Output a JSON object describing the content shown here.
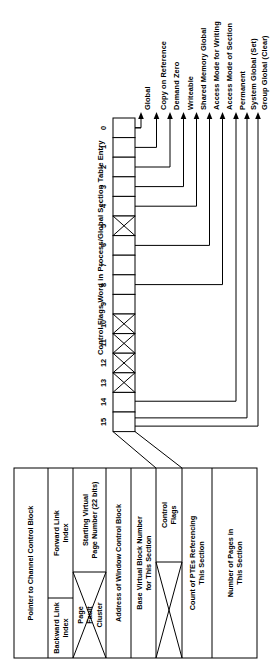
{
  "figure": {
    "title": "Control Flags Word in Process/Global Section Table Entry",
    "orientation": "rotated-90-ccw",
    "ink_color": "#000000",
    "paper_color": "#ffffff"
  },
  "bitfield": {
    "name": "control-flags-word",
    "bit_count": 16,
    "bit_labels": [
      "0",
      "1",
      "2",
      "3",
      "4",
      "5",
      "6",
      "7",
      "8",
      "9",
      "10",
      "11",
      "12",
      "13",
      "14",
      "15"
    ],
    "reserved_bits": [
      5,
      10,
      11,
      12,
      13
    ],
    "reserved_marker": "x-hatch"
  },
  "callouts": [
    {
      "bit": 0,
      "label": "Global"
    },
    {
      "bit": 1,
      "label": "Copy on Reference"
    },
    {
      "bit": 2,
      "label": "Demand Zero"
    },
    {
      "bit": 3,
      "label": "Writeable"
    },
    {
      "bit": 4,
      "label": "Shared Memory Global"
    },
    {
      "bit": 6,
      "label": "Access Mode for Writing"
    },
    {
      "bit": 8,
      "label": "Access Mode of Section"
    },
    {
      "bit": 14,
      "label": "Permanent"
    },
    {
      "bit": 15,
      "label": "System Global (Set)"
    },
    {
      "bit": 15,
      "label": "Group Global (Clear)"
    }
  ],
  "entry_table": {
    "name": "process-global-section-table-entry",
    "rows": [
      {
        "id": "row-0",
        "split": false,
        "label": "Pointer to Channel Control Block"
      },
      {
        "id": "row-1",
        "split": true,
        "left_label": "Forward Link\nIndex",
        "right_label": "Backward Link\nIndex"
      },
      {
        "id": "row-2",
        "split": true,
        "xhatch": true,
        "left_label": "Starting Virtual\nPage Number (22 bits)",
        "right_label": "Page\nFault\nCluster"
      },
      {
        "id": "row-3",
        "split": false,
        "label": "Address of Window Control Block"
      },
      {
        "id": "row-4",
        "split": false,
        "label": "Base Virtual Block Number\nfor This Section"
      },
      {
        "id": "row-5",
        "split": true,
        "xhatch": true,
        "left_label": "Control\nFlags",
        "right_label": ""
      },
      {
        "id": "row-6",
        "split": false,
        "label": "Count of PTEs Referencing\nThis Section"
      },
      {
        "id": "row-7",
        "split": false,
        "label": "Number of Pages in\nThis Section"
      }
    ]
  }
}
